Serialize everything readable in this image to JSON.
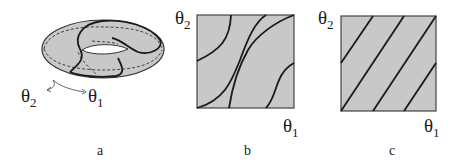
{
  "figure": {
    "fill_color": "#c8c8c8",
    "stroke_color": "#1a1a1a",
    "panels": [
      {
        "id": "a",
        "caption": "a",
        "type": "torus",
        "labels": {
          "theta2": {
            "sym": "θ",
            "sub": "2"
          },
          "theta1": {
            "sym": "θ",
            "sub": "1"
          }
        }
      },
      {
        "id": "b",
        "caption": "b",
        "type": "unit-square-curves",
        "labels": {
          "theta2": {
            "sym": "θ",
            "sub": "2"
          },
          "theta1": {
            "sym": "θ",
            "sub": "1"
          }
        }
      },
      {
        "id": "c",
        "caption": "c",
        "type": "unit-square-straight-lines",
        "labels": {
          "theta2": {
            "sym": "θ",
            "sub": "2"
          },
          "theta1": {
            "sym": "θ",
            "sub": "1"
          }
        }
      }
    ]
  }
}
